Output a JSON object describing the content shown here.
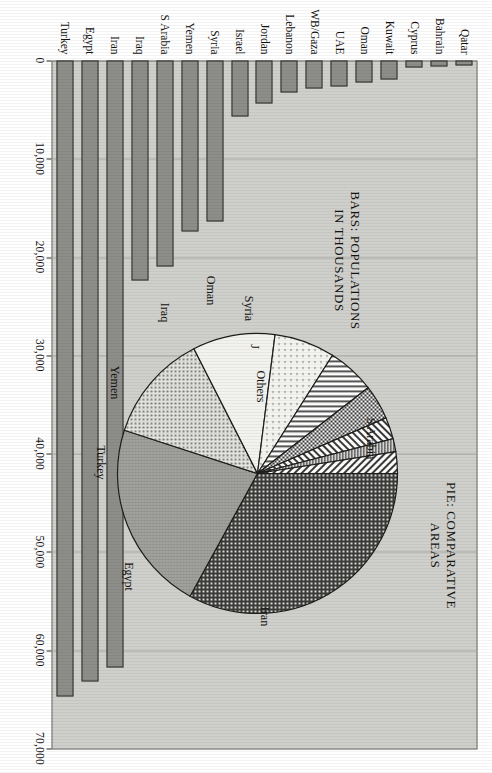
{
  "figure": {
    "bars_title": "BARS: POPULATIONS\nIN THOUSANDS",
    "pie_title": "PIE: COMPARATIVE\nAREAS",
    "background_color": "#cfcfcc",
    "bar_fill_color": "#8d8d8a",
    "bar_border_color": "#2d2d2b"
  },
  "chart_data": {
    "type": "bar",
    "title": "BARS: POPULATIONS IN THOUSANDS",
    "xlabel": "",
    "ylabel": "Population (thousands)",
    "ylim": [
      0,
      70000
    ],
    "grid": true,
    "orientation": "vertical",
    "tick_labels": [
      "0",
      "10,000",
      "20,000",
      "30,000",
      "40,000",
      "50,000",
      "60,000",
      "70,000"
    ],
    "tick_values": [
      0,
      10000,
      20000,
      30000,
      40000,
      50000,
      60000,
      70000
    ],
    "categories": [
      "Qatar",
      "Bahrain",
      "Cyprus",
      "Kuwait",
      "Oman",
      "UAE",
      "WB/Gaza",
      "Lebanon",
      "Jordan",
      "Israel",
      "Syria",
      "Yemen",
      "S Arabia",
      "Iraq",
      "Iran",
      "Egypt",
      "Turkey"
    ],
    "values": [
      550,
      600,
      750,
      1900,
      2200,
      2600,
      2800,
      3300,
      4400,
      5700,
      16400,
      17400,
      21000,
      22400,
      61800,
      63200,
      64700
    ]
  },
  "pie_data": {
    "type": "pie",
    "title": "PIE: COMPARATIVE AREAS",
    "labels": [
      "S Arabia",
      "Iran",
      "Egypt",
      "Turkey",
      "Yemen",
      "Iraq",
      "Oman",
      "Syria",
      "J",
      "Others"
    ],
    "values": [
      33.0,
      22.0,
      12.5,
      9.5,
      7.0,
      5.5,
      4.0,
      2.5,
      1.5,
      2.5
    ],
    "legend": "inline-labels"
  },
  "pie_labels": [
    {
      "text": "S Arabia",
      "x": 108,
      "y": 30
    },
    {
      "text": "Iran",
      "x": 286,
      "y": 136
    },
    {
      "text": "Egypt",
      "x": 246,
      "y": 272
    },
    {
      "text": "Turkey",
      "x": 132,
      "y": 300
    },
    {
      "text": "Yemen",
      "x": 52,
      "y": 286
    },
    {
      "text": "Iraq",
      "x": -18,
      "y": 236
    },
    {
      "text": "Oman",
      "x": -40,
      "y": 190
    },
    {
      "text": "Syria",
      "x": -22,
      "y": 152
    },
    {
      "text": "J",
      "x": 16,
      "y": 146
    },
    {
      "text": "Others",
      "x": 56,
      "y": 140
    }
  ]
}
